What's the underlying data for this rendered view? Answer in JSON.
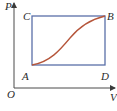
{
  "diagram": {
    "type": "P-V diagram",
    "axes": {
      "y_label": "P",
      "x_label": "V",
      "origin_label": "O"
    },
    "points": {
      "A": "A",
      "B": "B",
      "C": "C",
      "D": "D"
    },
    "colors": {
      "axes": "#4a4a4a",
      "rectangle": "#5a6fa8",
      "curve": "#b5553a",
      "text": "#2b2b2b"
    }
  }
}
